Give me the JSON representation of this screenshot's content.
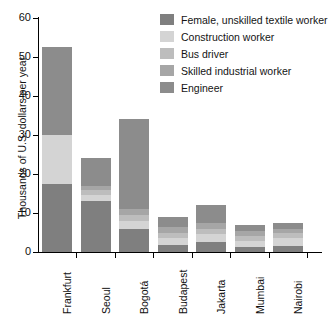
{
  "chart_data": {
    "type": "bar",
    "subtype": "stacked",
    "title": "",
    "xlabel": "",
    "ylabel": "Thousands of U.S. dollars per year",
    "ylim": [
      0,
      60
    ],
    "yticks": [
      0,
      10,
      20,
      30,
      40,
      50,
      60
    ],
    "ytick_labels": [
      "0",
      "10",
      "20",
      "30",
      "40",
      "50",
      "60"
    ],
    "grid": false,
    "legend_position": "top-right",
    "categories": [
      "Frankfurt",
      "Seoul",
      "Bogotá",
      "Budapest",
      "Jakarta",
      "Mumbai",
      "Nairobi"
    ],
    "series": [
      {
        "name": "Female, unskilled textile worker",
        "color": "#7f7f7f",
        "values": [
          17.5,
          13.0,
          6.0,
          1.8,
          2.5,
          1.3,
          1.5
        ]
      },
      {
        "name": "Construction worker",
        "color": "#d4d4d4",
        "values": [
          12.5,
          1.5,
          2.0,
          1.7,
          2.0,
          1.6,
          2.0
        ]
      },
      {
        "name": "Bus driver",
        "color": "#bdbdbd",
        "values": [
          0.0,
          1.5,
          1.5,
          1.5,
          1.5,
          1.3,
          1.5
        ]
      },
      {
        "name": "Skilled industrial worker",
        "color": "#a6a6a6",
        "values": [
          0.0,
          1.0,
          1.5,
          1.5,
          1.5,
          1.3,
          1.0
        ]
      },
      {
        "name": "Engineer",
        "color": "#8c8c8c",
        "values": [
          22.5,
          7.0,
          23.0,
          2.5,
          4.5,
          1.5,
          1.5
        ]
      }
    ],
    "totals": [
      52.5,
      24.0,
      34.0,
      9.0,
      12.0,
      7.0,
      7.5
    ]
  },
  "legend": {
    "items": [
      {
        "label": "Female, unskilled textile worker",
        "color": "#7f7f7f"
      },
      {
        "label": "Construction worker",
        "color": "#d4d4d4"
      },
      {
        "label": "Bus driver",
        "color": "#bdbdbd"
      },
      {
        "label": "Skilled industrial worker",
        "color": "#a6a6a6"
      },
      {
        "label": "Engineer",
        "color": "#8c8c8c"
      }
    ]
  },
  "axes": {
    "y_title": "Thousands of U.S. dollars per year"
  }
}
